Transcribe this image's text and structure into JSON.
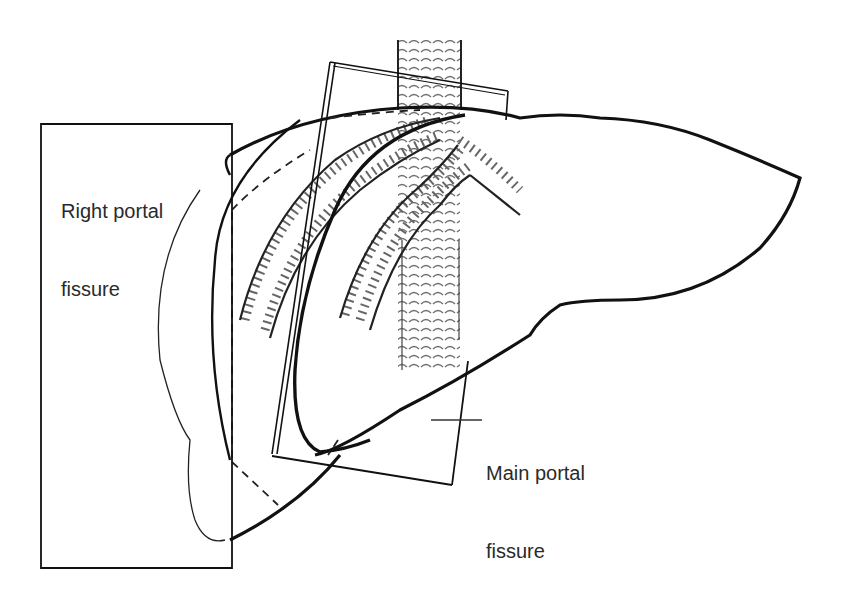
{
  "figure": {
    "labels": {
      "right_portal_fissure": {
        "line1": "Right portal",
        "line2": "fissure"
      },
      "main_portal_fissure": {
        "line1": "Main portal",
        "line2": "fissure"
      }
    },
    "colors": {
      "outline": "#111111",
      "text": "#2a2a2a",
      "hatch": "#555555",
      "background": "#ffffff"
    }
  }
}
